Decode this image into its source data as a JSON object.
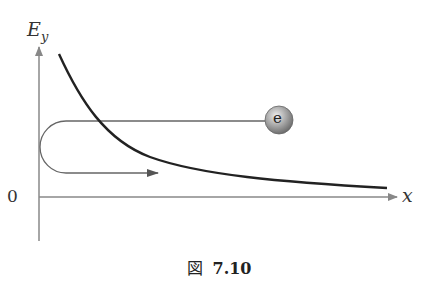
{
  "figure": {
    "y_axis_label": "E",
    "y_axis_subscript": "y",
    "x_axis_label": "x",
    "origin_label": "0",
    "particle_label": "e",
    "caption_prefix": "図",
    "caption_number": "7.10"
  },
  "colors": {
    "axis": "#888888",
    "curve": "#222222",
    "path": "#666666",
    "particle_light": "#e0e0e0",
    "particle_dark": "#7a7a7a"
  }
}
